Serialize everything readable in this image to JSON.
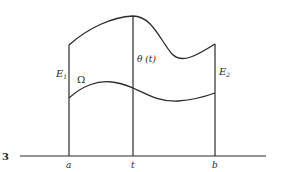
{
  "figure": {
    "fragment_label": "3",
    "colors": {
      "stroke": "#2a2a2a",
      "background": "#ffffff"
    },
    "labels": {
      "a": "a",
      "t": "t",
      "b": "b",
      "E1_main": "E",
      "E1_sub": "1",
      "E2_main": "E",
      "E2_sub": "2",
      "omega": "Ω",
      "theta": "θ (t)"
    },
    "elements": {
      "baseline": "horizontal axis",
      "left_boundary": "vertical line at a (E1)",
      "middle_section": "vertical line at t (θ(t))",
      "right_boundary": "vertical line at b (E2)",
      "upper_curve": "top boundary of region",
      "lower_curve": "bottom boundary of region"
    }
  }
}
